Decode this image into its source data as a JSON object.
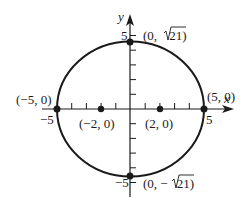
{
  "figure": {
    "type": "ellipse-graph",
    "equation_implied": "x^2/25 + y^2/21 = 1",
    "colors": {
      "ink": "#1a1a1a",
      "background": "#ffffff"
    }
  },
  "axes": {
    "x_label": "x",
    "y_label": "y",
    "x_ticks": [
      -5,
      -4,
      -3,
      -2,
      -1,
      1,
      2,
      3,
      4,
      5
    ],
    "y_ticks": [
      -5,
      -4,
      -3,
      -2,
      -1,
      1,
      2,
      3,
      4,
      5
    ],
    "x_tick_labels": {
      "neg": "−5",
      "pos": "5"
    },
    "y_tick_labels": {
      "pos": "5",
      "neg": "−5"
    }
  },
  "points": {
    "vertex_left": {
      "label": "(−5, 0)",
      "x": -5,
      "y": 0
    },
    "vertex_right": {
      "label": "(5, 0)",
      "x": 5,
      "y": 0
    },
    "covertex_top": {
      "label_prefix": "(0, ",
      "label_rad": "21",
      "label_suffix": ")",
      "x": 0,
      "y": 4.583
    },
    "covertex_bottom": {
      "label_prefix": "(0, −",
      "label_rad": "21",
      "label_suffix": ")",
      "x": 0,
      "y": -4.583
    },
    "focus_left": {
      "label": "(−2, 0)",
      "x": -2,
      "y": 0
    },
    "focus_right": {
      "label": "(2, 0)",
      "x": 2,
      "y": 0
    }
  }
}
